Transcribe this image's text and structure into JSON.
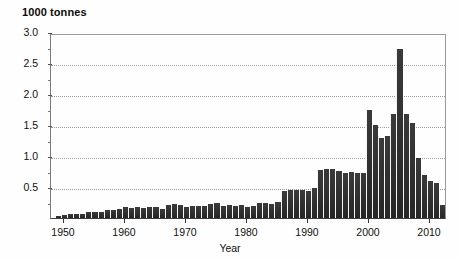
{
  "chart": {
    "type": "bar",
    "title": "",
    "ylabel": "1000 tonnes",
    "xlabel": "Year",
    "ylim": [
      0.0,
      3.0
    ],
    "xlim": [
      1948.5,
      2012.5
    ],
    "grid": true,
    "legend": null,
    "bar_color": "#2e2e2e",
    "ytick_labels": [
      "3.0",
      "2.5",
      "2.0",
      "1.5",
      "1.0",
      "0.5"
    ],
    "ytick_values": [
      3.0,
      2.5,
      2.0,
      1.5,
      1.0,
      0.5
    ],
    "xtick_labels": [
      "1950",
      "1960",
      "1970",
      "1980",
      "1990",
      "2000",
      "2010"
    ],
    "xtick_values": [
      1950,
      1960,
      1970,
      1980,
      1990,
      2000,
      2010
    ]
  },
  "chart_data": {
    "type": "bar",
    "title": "",
    "subtitle": "",
    "ylabel": "1000 tonnes",
    "xlabel": "Year",
    "ylim": [
      0.0,
      3.0
    ],
    "grid": true,
    "legend_position": "none",
    "categories": [
      1949,
      1950,
      1951,
      1952,
      1953,
      1954,
      1955,
      1956,
      1957,
      1958,
      1959,
      1960,
      1961,
      1962,
      1963,
      1964,
      1965,
      1966,
      1967,
      1968,
      1969,
      1970,
      1971,
      1972,
      1973,
      1974,
      1975,
      1976,
      1977,
      1978,
      1979,
      1980,
      1981,
      1982,
      1983,
      1984,
      1985,
      1986,
      1987,
      1988,
      1989,
      1990,
      1991,
      1992,
      1993,
      1994,
      1995,
      1996,
      1997,
      1998,
      1999,
      2000,
      2001,
      2002,
      2003,
      2004,
      2005,
      2006,
      2007,
      2008,
      2009,
      2010,
      2011,
      2012
    ],
    "values": [
      0.03,
      0.05,
      0.06,
      0.07,
      0.07,
      0.09,
      0.1,
      0.09,
      0.13,
      0.13,
      0.15,
      0.17,
      0.16,
      0.17,
      0.16,
      0.18,
      0.17,
      0.14,
      0.21,
      0.22,
      0.21,
      0.17,
      0.19,
      0.2,
      0.19,
      0.22,
      0.24,
      0.2,
      0.21,
      0.19,
      0.21,
      0.17,
      0.2,
      0.24,
      0.25,
      0.22,
      0.26,
      0.44,
      0.45,
      0.45,
      0.45,
      0.43,
      0.48,
      0.78,
      0.79,
      0.79,
      0.76,
      0.73,
      0.74,
      0.73,
      0.72,
      1.75,
      1.5,
      1.29,
      1.32,
      1.68,
      2.73,
      1.68,
      1.54,
      0.96,
      0.69,
      0.6,
      0.56,
      0.21
    ],
    "series": [
      {
        "name": "Production",
        "values": [
          0.03,
          0.05,
          0.06,
          0.07,
          0.07,
          0.09,
          0.1,
          0.09,
          0.13,
          0.13,
          0.15,
          0.17,
          0.16,
          0.17,
          0.16,
          0.18,
          0.17,
          0.14,
          0.21,
          0.22,
          0.21,
          0.17,
          0.19,
          0.2,
          0.19,
          0.22,
          0.24,
          0.2,
          0.21,
          0.19,
          0.21,
          0.17,
          0.2,
          0.24,
          0.25,
          0.22,
          0.26,
          0.44,
          0.45,
          0.45,
          0.45,
          0.43,
          0.48,
          0.78,
          0.79,
          0.79,
          0.76,
          0.73,
          0.74,
          0.73,
          0.72,
          1.75,
          1.5,
          1.29,
          1.32,
          1.68,
          2.73,
          1.68,
          1.54,
          0.96,
          0.69,
          0.6,
          0.56,
          0.21
        ]
      }
    ],
    "annotations": []
  },
  "plot_geometry": {
    "x_first_year": 1949,
    "x_last_year": 2012,
    "px_per_year": 6.1,
    "baseline_y_px": 219,
    "px_per_half_unit": 31
  }
}
